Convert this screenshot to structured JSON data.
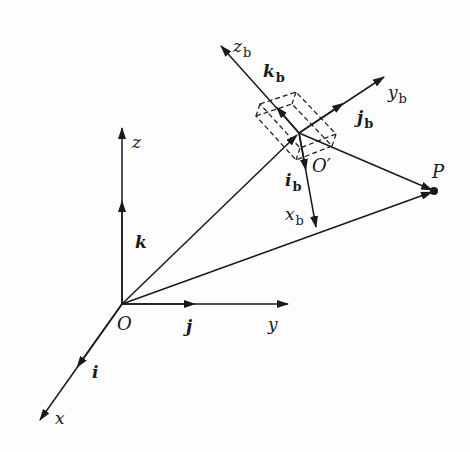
{
  "diagram": {
    "type": "coordinate-frames",
    "colors": {
      "ink": "#1a1a1a",
      "background": "#fdfdfd"
    },
    "world_frame": {
      "origin_label": "O",
      "axes": [
        {
          "axis": "x",
          "label": "x",
          "unit_vector": "i"
        },
        {
          "axis": "y",
          "label": "y",
          "unit_vector": "j"
        },
        {
          "axis": "z",
          "label": "z",
          "unit_vector": "k"
        }
      ]
    },
    "body_frame": {
      "origin_label": "O′",
      "axes": [
        {
          "axis": "x_b",
          "label": "x",
          "sub": "b",
          "unit_vector": "i",
          "unit_sub": "b"
        },
        {
          "axis": "y_b",
          "label": "y",
          "sub": "b",
          "unit_vector": "j",
          "unit_sub": "b"
        },
        {
          "axis": "z_b",
          "label": "z",
          "sub": "b",
          "unit_vector": "k",
          "unit_sub": "b"
        }
      ],
      "body_shape": "dashed box (rigid body)"
    },
    "point": {
      "label": "P"
    },
    "vectors": [
      {
        "from": "O",
        "to": "O′"
      },
      {
        "from": "O",
        "to": "P"
      },
      {
        "from": "O′",
        "to": "P"
      }
    ]
  }
}
